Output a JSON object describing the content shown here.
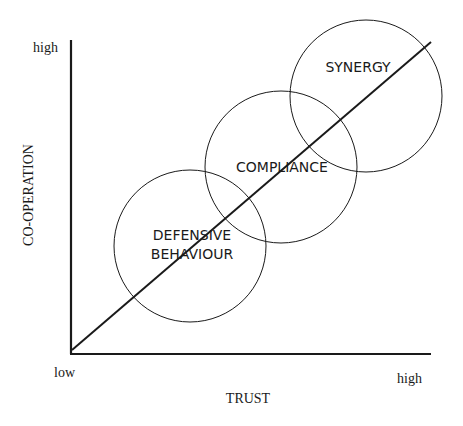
{
  "diagram": {
    "y_axis": {
      "label": "CO-OPERATION",
      "high_label": "high"
    },
    "x_axis": {
      "label": "TRUST",
      "low_label": "low",
      "high_label": "high"
    },
    "regions": [
      {
        "line1": "DEFENSIVE",
        "line2": "BEHAVIOUR"
      },
      {
        "line1": "COMPLIANCE"
      },
      {
        "line1": "SYNERGY"
      }
    ]
  },
  "colors": {
    "stroke": "#1a1a1a",
    "background": "#ffffff"
  }
}
